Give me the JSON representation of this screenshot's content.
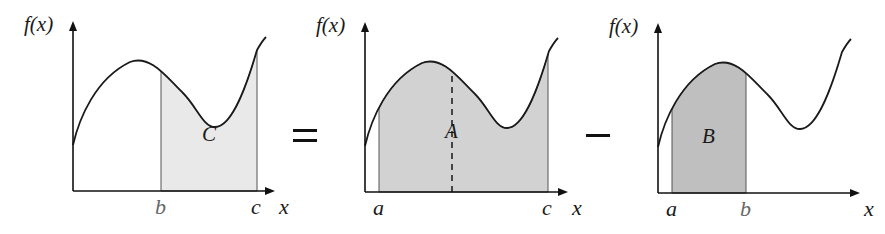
{
  "equation": {
    "operator_1": "=",
    "operator_2": "−"
  },
  "panels": [
    {
      "id": "panel-c",
      "y_axis_label": "f(x)",
      "x_axis_label": "x",
      "region_label": "C",
      "shade_color": "#e9e9e9",
      "bounds": [
        "b",
        "c"
      ],
      "ticks": [
        {
          "label": "b",
          "pos": 88
        },
        {
          "label": "c",
          "pos": 184
        }
      ],
      "shade_from": 88,
      "shade_to": 184,
      "dashed_at": null
    },
    {
      "id": "panel-a",
      "y_axis_label": "f(x)",
      "x_axis_label": "x",
      "region_label": "A",
      "shade_color": "#d2d2d2",
      "bounds": [
        "a",
        "c"
      ],
      "ticks": [
        {
          "label": "a",
          "pos": 14
        },
        {
          "label": "c",
          "pos": 183
        }
      ],
      "shade_from": 14,
      "shade_to": 183,
      "dashed_at": 87
    },
    {
      "id": "panel-b",
      "y_axis_label": "f(x)",
      "x_axis_label": "x",
      "region_label": "B",
      "shade_color": "#bfbfbf",
      "bounds": [
        "a",
        "b"
      ],
      "ticks": [
        {
          "label": "a",
          "pos": 14
        },
        {
          "label": "b",
          "pos": 88
        }
      ],
      "shade_from": 14,
      "shade_to": 88,
      "dashed_at": null
    }
  ]
}
